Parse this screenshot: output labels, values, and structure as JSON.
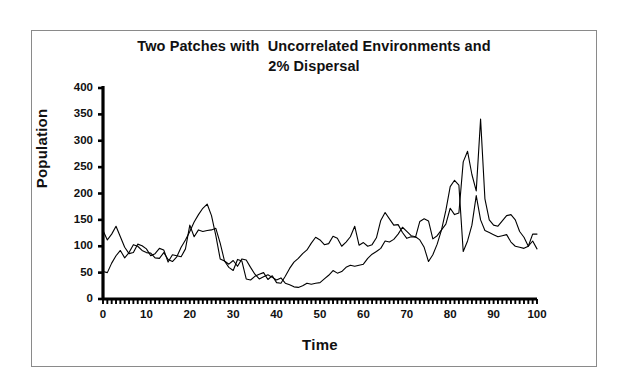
{
  "figure": {
    "title_line1": "Two Patches with  Uncorrelated Environments and",
    "title_line2": "2% Dispersal",
    "frame_color": "#8a8a8a",
    "background": "#ffffff"
  },
  "chart_data": {
    "type": "line",
    "title": "Two Patches with  Uncorrelated Environments and 2% Dispersal",
    "xlabel": "Time",
    "ylabel": "Population",
    "xlim": [
      0,
      100
    ],
    "ylim": [
      0,
      400
    ],
    "xticks": [
      0,
      10,
      20,
      30,
      40,
      50,
      60,
      70,
      80,
      90,
      100
    ],
    "xtick_labels": [
      "0",
      "10",
      "20",
      "30",
      "40",
      "50",
      "60",
      "70",
      "80",
      "90",
      "100"
    ],
    "yticks": [
      0,
      50,
      100,
      150,
      200,
      250,
      300,
      350,
      400
    ],
    "ytick_labels": [
      "0",
      "50",
      "100",
      "150",
      "200",
      "250",
      "300",
      "350",
      "400"
    ],
    "x_minor_tick_interval": 1,
    "grid": false,
    "legend": null,
    "line_color": "#000000",
    "line_width": 1.1,
    "x": [
      0,
      1,
      2,
      3,
      4,
      5,
      6,
      7,
      8,
      9,
      10,
      11,
      12,
      13,
      14,
      15,
      16,
      17,
      18,
      19,
      20,
      21,
      22,
      23,
      24,
      25,
      26,
      27,
      28,
      29,
      30,
      31,
      32,
      33,
      34,
      35,
      36,
      37,
      38,
      39,
      40,
      41,
      42,
      43,
      44,
      45,
      46,
      47,
      48,
      49,
      50,
      51,
      52,
      53,
      54,
      55,
      56,
      57,
      58,
      59,
      60,
      61,
      62,
      63,
      64,
      65,
      66,
      67,
      68,
      69,
      70,
      71,
      72,
      73,
      74,
      75,
      76,
      77,
      78,
      79,
      80,
      81,
      82,
      83,
      84,
      85,
      86,
      87,
      88,
      89,
      90,
      91,
      92,
      93,
      94,
      95,
      96,
      97,
      98,
      99,
      100
    ],
    "series": [
      {
        "name": "Patch 1",
        "values": [
          130,
          112,
          123,
          138,
          118,
          98,
          86,
          88,
          104,
          101,
          95,
          82,
          86,
          96,
          93,
          70,
          84,
          82,
          80,
          95,
          140,
          118,
          131,
          128,
          130,
          131,
          134,
          106,
          72,
          66,
          73,
          62,
          76,
          74,
          60,
          47,
          38,
          42,
          46,
          41,
          36,
          40,
          30,
          27,
          23,
          22,
          25,
          30,
          28,
          30,
          31,
          38,
          45,
          54,
          49,
          52,
          60,
          64,
          62,
          64,
          66,
          77,
          85,
          90,
          96,
          110,
          108,
          113,
          123,
          136,
          128,
          120,
          118,
          112,
          98,
          71,
          84,
          104,
          131,
          168,
          213,
          225,
          216,
          90,
          110,
          140,
          196,
          150,
          130,
          126,
          122,
          118,
          120,
          122,
          108,
          100,
          98,
          96,
          100,
          110,
          95
        ]
      },
      {
        "name": "Patch 2",
        "values": [
          52,
          50,
          68,
          82,
          92,
          78,
          88,
          103,
          100,
          92,
          88,
          87,
          78,
          77,
          88,
          75,
          71,
          80,
          98,
          112,
          128,
          146,
          160,
          172,
          180,
          158,
          120,
          76,
          72,
          60,
          54,
          75,
          72,
          38,
          36,
          43,
          47,
          50,
          37,
          44,
          31,
          30,
          43,
          58,
          70,
          77,
          86,
          93,
          106,
          117,
          112,
          103,
          105,
          119,
          115,
          100,
          108,
          118,
          138,
          102,
          107,
          100,
          103,
          116,
          149,
          164,
          152,
          140,
          141,
          126,
          115,
          118,
          117,
          147,
          152,
          148,
          114,
          120,
          131,
          142,
          172,
          160,
          163,
          260,
          280,
          236,
          205,
          341,
          190,
          150,
          140,
          138,
          148,
          158,
          160,
          150,
          128,
          117,
          100,
          123,
          123
        ]
      }
    ]
  },
  "axes": {
    "plot_left_px": 103,
    "plot_right_px": 537,
    "plot_top_px": 88,
    "plot_bottom_px": 299
  }
}
